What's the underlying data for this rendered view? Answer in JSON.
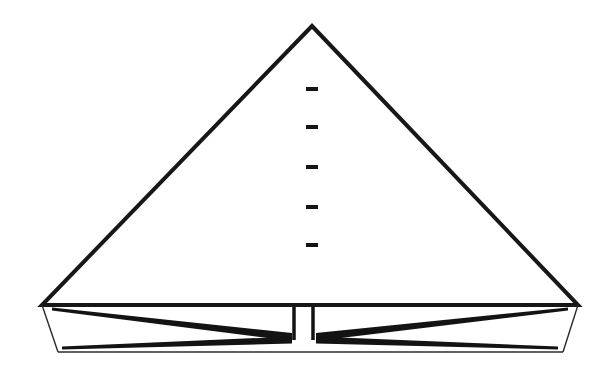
{
  "figure": {
    "name": "triangular-diagram",
    "background_color": "#ffffff",
    "line_color": "#141414",
    "width": 613,
    "height": 374,
    "parts": {
      "triangle": {
        "name": "large-triangle",
        "apex": [
          312,
          26
        ],
        "base_left": [
          42,
          305
        ],
        "base_right": [
          578,
          305
        ],
        "stroke_width": 4
      },
      "center_dashes": {
        "name": "center-dash-column",
        "count": 5,
        "x_left": 306,
        "x_right": 318,
        "thickness": 4,
        "y_positions": [
          89,
          127,
          167,
          207,
          245
        ]
      },
      "base_trapezoid": {
        "name": "lower-trapezoid",
        "top_left": [
          42,
          305
        ],
        "top_right": [
          578,
          305
        ],
        "bottom_left": [
          58,
          352
        ],
        "bottom_right": [
          563,
          352
        ],
        "stroke_width": 1.4
      },
      "left_wedge_upper": {
        "name": "left-upper-wedge",
        "from": [
          52,
          309
        ],
        "to": [
          292,
          337
        ]
      },
      "left_wedge_lower": {
        "name": "left-lower-wedge",
        "from": [
          292,
          340
        ],
        "to": [
          62,
          348
        ]
      },
      "right_wedge_upper": {
        "name": "right-upper-wedge",
        "from": [
          568,
          309
        ],
        "to": [
          316,
          337
        ]
      },
      "right_wedge_lower": {
        "name": "right-lower-wedge",
        "from": [
          316,
          340
        ],
        "to": [
          558,
          348
        ]
      },
      "center_gap": {
        "name": "center-vertical-gap",
        "left_bar_x": 294,
        "right_bar_x": 313,
        "top_y": 307,
        "bottom_y": 340,
        "gap_width": 19
      }
    }
  }
}
